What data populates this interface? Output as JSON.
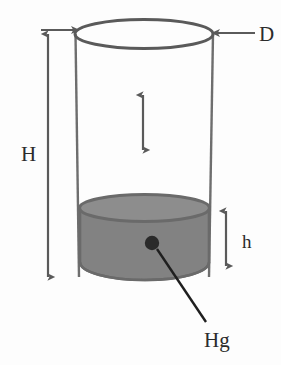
{
  "figure": {
    "background_color": "#fdfdfd",
    "labels": {
      "height_total": "H",
      "diameter": "D",
      "height_mercury": "h",
      "substance": "Hg"
    },
    "colors": {
      "outline": "#5a5a5a",
      "mercury_body": "#828282",
      "mercury_top_surface": "#8d8d8d",
      "mercury_rim": "#6a6a6a",
      "marker_dot": "#2a2a2a",
      "leader_line": "#1f1f1f",
      "arrow": "#5a5a5a",
      "text": "#2b2b2b"
    },
    "geometry": {
      "cylinder_top_ellipse": {
        "cx": 144,
        "cy": 34,
        "rx": 69,
        "ry": 14
      },
      "cylinder_left_wall_x": 76,
      "cylinder_right_wall_x": 209,
      "mercury_top_y": 207,
      "mercury_bottom_y": 276,
      "mercury_ellipse_rx": 67,
      "mercury_ellipse_ry": 14,
      "marker_dot": {
        "cx": 152,
        "cy": 243,
        "r": 7
      }
    },
    "annotations": [
      {
        "name": "total-height-arrow",
        "label": "H",
        "kind": "double-headed-vertical",
        "x": 48,
        "y_top": 30,
        "y_bottom": 281
      },
      {
        "name": "diameter-arrow",
        "label": "D",
        "kind": "single-headed-horizontal-left",
        "y": 33,
        "x_start": 256,
        "x_end": 213
      },
      {
        "name": "diameter-arrow-left",
        "label": "",
        "kind": "single-headed-horizontal-right",
        "y": 30,
        "x_start": 42,
        "x_end": 78
      },
      {
        "name": "mercury-height-arrow",
        "label": "h",
        "kind": "double-headed-vertical",
        "x": 226,
        "y_top": 210,
        "y_bottom": 266
      },
      {
        "name": "interior-gap-arrow",
        "label": "",
        "kind": "double-headed-vertical",
        "x": 143,
        "y_top": 93,
        "y_bottom": 151
      },
      {
        "name": "mercury-leader-line",
        "label": "Hg",
        "kind": "leader",
        "x_start": 156,
        "y_start": 248,
        "x_end": 205,
        "y_end": 322
      }
    ],
    "label_positions": {
      "H": {
        "x": 22,
        "y": 160
      },
      "D": {
        "x": 258,
        "y": 41
      },
      "h": {
        "x": 241,
        "y": 247
      },
      "Hg": {
        "x": 204,
        "y": 346
      }
    }
  }
}
